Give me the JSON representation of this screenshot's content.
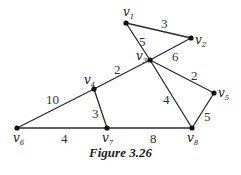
{
  "figure": {
    "caption": "Figure 3.26"
  },
  "graph": {
    "nodes": [
      {
        "id": "v1",
        "label": "v",
        "sub": "1",
        "x": 126,
        "y": 23
      },
      {
        "id": "v2",
        "label": "v",
        "sub": "2",
        "x": 191,
        "y": 38
      },
      {
        "id": "v3",
        "label": "v",
        "sub": "3",
        "x": 150,
        "y": 60
      },
      {
        "id": "v4",
        "label": "v",
        "sub": "4",
        "x": 94,
        "y": 89
      },
      {
        "id": "v5",
        "label": "v",
        "sub": "5",
        "x": 214,
        "y": 93
      },
      {
        "id": "v6",
        "label": "v",
        "sub": "6",
        "x": 17,
        "y": 128
      },
      {
        "id": "v7",
        "label": "v",
        "sub": "7",
        "x": 107,
        "y": 128
      },
      {
        "id": "v8",
        "label": "v",
        "sub": "8",
        "x": 192,
        "y": 128
      }
    ],
    "edges": [
      {
        "from": "v1",
        "to": "v2",
        "weight": "3"
      },
      {
        "from": "v1",
        "to": "v3",
        "weight": "5"
      },
      {
        "from": "v2",
        "to": "v3",
        "weight": "6"
      },
      {
        "from": "v3",
        "to": "v4",
        "weight": "2"
      },
      {
        "from": "v3",
        "to": "v5",
        "weight": "2"
      },
      {
        "from": "v3",
        "to": "v8",
        "weight": "4"
      },
      {
        "from": "v4",
        "to": "v6",
        "weight": "10"
      },
      {
        "from": "v4",
        "to": "v7",
        "weight": "3"
      },
      {
        "from": "v5",
        "to": "v8",
        "weight": "5"
      },
      {
        "from": "v6",
        "to": "v7",
        "weight": "4"
      },
      {
        "from": "v7",
        "to": "v8",
        "weight": "8"
      }
    ]
  }
}
